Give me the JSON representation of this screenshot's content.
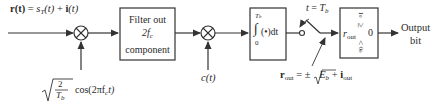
{
  "diagram": {
    "type": "block-diagram",
    "title": "",
    "input": {
      "label_lhs": "r(t)",
      "label_eq": "=",
      "label_s": "s",
      "label_s_sub": "T",
      "label_s_arg": "(t)",
      "label_plus": "+",
      "label_i": "i",
      "label_i_arg": "(t)"
    },
    "mixer1": {
      "symbol": "⊗",
      "carrier_sqrt_num": "2",
      "carrier_sqrt_den_T": "T",
      "carrier_sqrt_den_sub": "b",
      "carrier_text": "cos(2πf",
      "carrier_sub": "c",
      "carrier_tail": "t)"
    },
    "filter": {
      "line1": "Filter out",
      "line2_main": "2f",
      "line2_sub": "c",
      "line3": "component"
    },
    "mixer2": {
      "symbol": "⊗",
      "spreading_label": "c(t)"
    },
    "integrator": {
      "upper_limit": "T",
      "upper_limit_sub": "b",
      "integral_sign": "∫",
      "lower_limit": "0",
      "integrand": "(•)dt"
    },
    "sampler": {
      "label_t": "t",
      "label_eq": "=",
      "label_T": "T",
      "label_sub": "b"
    },
    "decision": {
      "top_symbol": "1",
      "top_sub": "0",
      "ge": "≥",
      "var": "r",
      "var_sub": "out",
      "threshold": "0",
      "le": "<",
      "bottom_symbol": "0",
      "bottom_sub": "0"
    },
    "output": {
      "line1": "Output",
      "line2": "bit"
    },
    "rout_equation": {
      "lhs": "r",
      "lhs_sub": "out",
      "eq": "= ±",
      "sqrt_E": "E",
      "sqrt_sub": "b",
      "plus": "+",
      "i": "i",
      "i_sub": "out"
    },
    "colors": {
      "stroke": "#333333",
      "background": "#ffffff"
    }
  }
}
